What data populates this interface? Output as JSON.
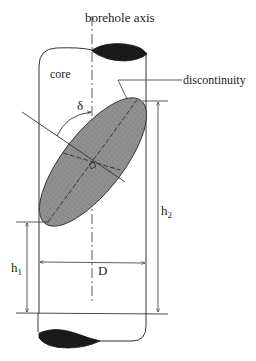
{
  "diagram": {
    "labels": {
      "borehole_axis": "borehole axis",
      "core": "core",
      "discontinuity": "discontinuity",
      "delta": "δ",
      "h2": "h",
      "h2_sub": "2",
      "h1": "h",
      "h1_sub": "1",
      "D": "D"
    },
    "colors": {
      "line": "#333333",
      "ellipse_fill": "#8c8c8c",
      "cap_fill": "#1a1a1a"
    }
  }
}
